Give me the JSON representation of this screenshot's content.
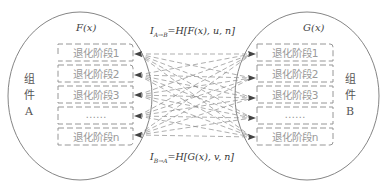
{
  "diagram": {
    "component_a": {
      "label_chars": [
        "组",
        "件",
        "A"
      ],
      "function": "F(x)",
      "stages": [
        "退化阶段1",
        "退化阶段2",
        "退化阶段3",
        "……",
        "退化阶段n"
      ]
    },
    "component_b": {
      "label_chars": [
        "组",
        "件",
        "B"
      ],
      "function": "G(x)",
      "stages": [
        "退化阶段1",
        "退化阶段2",
        "退化阶段3",
        "……",
        "退化阶段n"
      ]
    },
    "formula_a_to_b": {
      "lhs": "I",
      "subscript": "A→B",
      "rhs": "=H[F(x), u, n]"
    },
    "formula_b_to_a": {
      "lhs": "I",
      "subscript": "B→A",
      "rhs": "=H[G(x), v, n]"
    },
    "colors": {
      "outline": "#777777",
      "dashed_box": "#8a8a8a",
      "connector": "#8c8c8c",
      "arrowhead": "#444444",
      "stage_text": "#9a9a9a"
    }
  }
}
